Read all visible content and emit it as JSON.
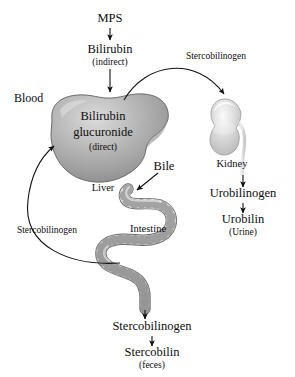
{
  "diagram": {
    "colors": {
      "background": "#ffffff",
      "text": "#0d0d0d",
      "arrow": "#111111",
      "liver_fill": "#a8a8a8",
      "liver_highlight": "#d6d6d6",
      "liver_shadow": "#7d7d7d",
      "kidney_fill": "#d2d2d2",
      "kidney_highlight": "#f2f2f2",
      "intestine_fill": "#c0c0c0",
      "intestine_highlight": "#e8e8e8",
      "organ_outline": "#5f5f5f"
    },
    "nodes": [
      {
        "id": "mps",
        "label": "MPS",
        "sub": "",
        "x": 110,
        "y": 12
      },
      {
        "id": "bilirubin",
        "label": "Bilirubin",
        "sub": "(indirect)",
        "x": 110,
        "y": 43
      },
      {
        "id": "blood",
        "label": "Blood",
        "sub": "",
        "x": 33,
        "y": 92
      },
      {
        "id": "bilirubin-gluc",
        "label": "Bilirubin",
        "sub": "glucuronide",
        "x": 103,
        "y": 115
      },
      {
        "id": "direct",
        "label": "(direct)",
        "sub": "",
        "x": 103,
        "y": 145
      },
      {
        "id": "liver",
        "label": "Liver",
        "sub": "",
        "x": 103,
        "y": 183
      },
      {
        "id": "bile",
        "label": "Bile",
        "sub": "",
        "x": 162,
        "y": 165
      },
      {
        "id": "intestine",
        "label": "Intestine",
        "sub": "",
        "x": 148,
        "y": 228
      },
      {
        "id": "kidney",
        "label": "Kidney",
        "sub": "",
        "x": 235,
        "y": 162
      },
      {
        "id": "urobilinogen",
        "label": "Urobilinogen",
        "sub": "",
        "x": 243,
        "y": 191
      },
      {
        "id": "urobilin",
        "label": "Urobilin",
        "sub": "(Urine)",
        "x": 243,
        "y": 216
      },
      {
        "id": "sterco-arc-top",
        "label": "Stercobilinogen",
        "sub": "",
        "x": 216,
        "y": 52
      },
      {
        "id": "sterco-arc-left",
        "label": "Stercobilinogen",
        "sub": "",
        "x": 47,
        "y": 228
      },
      {
        "id": "stercobilinogen",
        "label": "Stercobilinogen",
        "sub": "",
        "x": 152,
        "y": 322
      },
      {
        "id": "stercobilin",
        "label": "Stercobilin",
        "sub": "(feces)",
        "x": 152,
        "y": 350
      }
    ],
    "edges": [
      {
        "id": "mps-to-bilirubin",
        "from": "mps",
        "to": "bilirubin",
        "type": "straight"
      },
      {
        "id": "bilirubin-to-liver",
        "from": "bilirubin",
        "to": "liver",
        "type": "straight"
      },
      {
        "id": "liver-to-kidney",
        "from": "blood",
        "to": "kidney",
        "type": "arc",
        "label": "Stercobilinogen"
      },
      {
        "id": "liver-to-intestine",
        "from": "liver",
        "to": "intestine",
        "type": "straight",
        "label": "Bile"
      },
      {
        "id": "intestine-to-liver",
        "from": "intestine",
        "to": "liver",
        "type": "arc",
        "label": "Stercobilinogen"
      },
      {
        "id": "kidney-to-urobilinogen",
        "from": "kidney",
        "to": "urobilinogen",
        "type": "straight"
      },
      {
        "id": "urobilinogen-to-urobilin",
        "from": "urobilinogen",
        "to": "urobilin",
        "type": "straight"
      },
      {
        "id": "intestine-to-sterco",
        "from": "intestine",
        "to": "stercobilinogen",
        "type": "straight"
      },
      {
        "id": "sterco-to-stercobilin",
        "from": "stercobilinogen",
        "to": "stercobilin",
        "type": "straight"
      }
    ],
    "organs": [
      {
        "id": "liver-shape",
        "name": "liver"
      },
      {
        "id": "kidney-shape",
        "name": "kidney"
      },
      {
        "id": "intestine-shape",
        "name": "intestine"
      }
    ]
  }
}
